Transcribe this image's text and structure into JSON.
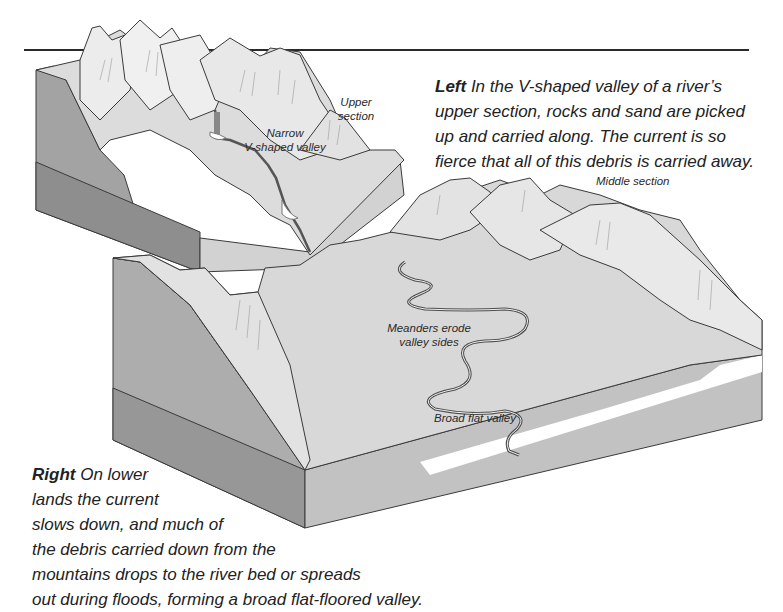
{
  "figure": {
    "colors": {
      "rule": "#2a2a2a",
      "block_side_dark": "#9a9a9a",
      "block_side_mid": "#b4b4b4",
      "block_top": "#d6d6d6",
      "mountain": "#e6e6e6",
      "line": "#3a3a3a"
    }
  },
  "captions": {
    "left": {
      "lead": "Left",
      "text": " In the V-shaped valley of a river’s upper section, rocks and sand are picked up and carried along. The current is so fierce that all of this debris is carried away."
    },
    "right": {
      "lead": "Right",
      "lines": [
        " On lower",
        "lands the current",
        "slows down, and much of",
        "the debris carried down from the",
        "mountains drops to the river bed or spreads",
        "out during floods, forming a broad flat-floored valley."
      ]
    }
  },
  "labels": {
    "upper_line1": "Upper",
    "upper_line2": "section",
    "narrow_line1": "Narrow",
    "narrow_line2": "V-shaped valley",
    "middle": "Middle section",
    "meanders_line1": "Meanders erode",
    "meanders_line2": "valley sides",
    "broad": "Broad flat valley"
  }
}
